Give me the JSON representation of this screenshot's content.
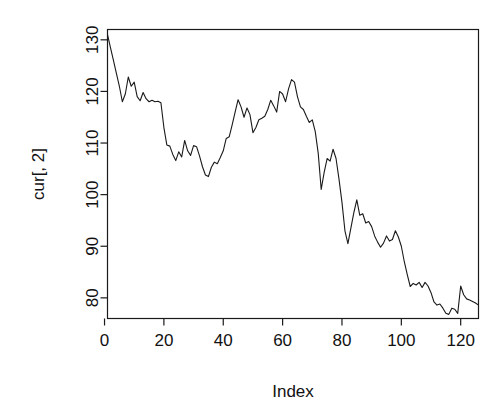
{
  "chart_data": {
    "type": "line",
    "title": "",
    "xlabel": "Index",
    "ylabel": "cur[, 2]",
    "xlim": [
      1,
      126
    ],
    "ylim": [
      76,
      132
    ],
    "xticks": [
      0,
      20,
      40,
      60,
      80,
      100,
      120
    ],
    "xtick_labels": [
      "0",
      "20",
      "40",
      "60",
      "80",
      "100",
      "120"
    ],
    "yticks": [
      80,
      90,
      100,
      110,
      120,
      130
    ],
    "ytick_labels": [
      "80",
      "90",
      "100",
      "110",
      "120",
      "130"
    ],
    "grid": false,
    "legend": null,
    "line_color": "#1a1a1a",
    "series": [
      {
        "name": "cur[, 2]",
        "x": [
          1,
          2,
          3,
          4,
          5,
          6,
          7,
          8,
          9,
          10,
          11,
          12,
          13,
          14,
          15,
          16,
          17,
          18,
          19,
          20,
          21,
          22,
          23,
          24,
          25,
          26,
          27,
          28,
          29,
          30,
          31,
          32,
          33,
          34,
          35,
          36,
          37,
          38,
          39,
          40,
          41,
          42,
          43,
          44,
          45,
          46,
          47,
          48,
          49,
          50,
          51,
          52,
          53,
          54,
          55,
          56,
          57,
          58,
          59,
          60,
          61,
          62,
          63,
          64,
          65,
          66,
          67,
          68,
          69,
          70,
          71,
          72,
          73,
          74,
          75,
          76,
          77,
          78,
          79,
          80,
          81,
          82,
          83,
          84,
          85,
          86,
          87,
          88,
          89,
          90,
          91,
          92,
          93,
          94,
          95,
          96,
          97,
          98,
          99,
          100,
          101,
          102,
          103,
          104,
          105,
          106,
          107,
          108,
          109,
          110,
          111,
          112,
          113,
          114,
          115,
          116,
          117,
          118,
          119,
          120,
          121,
          122,
          123,
          124,
          125,
          126
        ],
        "values": [
          131.0,
          128.5,
          126.0,
          123.5,
          121.0,
          118.0,
          119.5,
          122.8,
          121.0,
          121.8,
          119.0,
          118.2,
          119.8,
          118.6,
          118.0,
          118.3,
          118.0,
          118.1,
          117.8,
          113.0,
          109.6,
          109.4,
          107.8,
          106.6,
          108.3,
          107.3,
          110.5,
          108.5,
          107.6,
          109.5,
          109.3,
          107.5,
          105.4,
          103.8,
          103.5,
          105.3,
          106.3,
          106.0,
          107.2,
          108.5,
          110.9,
          111.2,
          113.5,
          116.0,
          118.4,
          117.0,
          115.0,
          116.8,
          115.5,
          112.0,
          113.0,
          114.5,
          114.8,
          115.2,
          116.5,
          118.3,
          117.2,
          116.0,
          120.0,
          119.5,
          118.0,
          120.5,
          122.3,
          121.8,
          119.0,
          117.0,
          116.5,
          115.2,
          114.0,
          114.5,
          112.2,
          108.0,
          101.0,
          104.3,
          107.0,
          106.5,
          108.8,
          107.0,
          103.0,
          98.5,
          93.0,
          90.5,
          93.5,
          96.5,
          99.0,
          96.0,
          96.3,
          94.5,
          94.8,
          93.8,
          92.0,
          90.8,
          89.8,
          90.6,
          92.0,
          91.0,
          91.3,
          93.0,
          91.8,
          90.0,
          87.0,
          84.5,
          82.2,
          82.8,
          82.5,
          83.0,
          82.0,
          83.0,
          82.3,
          81.0,
          79.2,
          78.6,
          78.8,
          78.0,
          77.0,
          76.8,
          78.0,
          77.8,
          77.0,
          82.3,
          80.6,
          79.8,
          79.6,
          79.3,
          79.0,
          78.6
        ]
      }
    ]
  },
  "axes": {
    "y_title": "cur[, 2]",
    "x_title": "Index"
  }
}
